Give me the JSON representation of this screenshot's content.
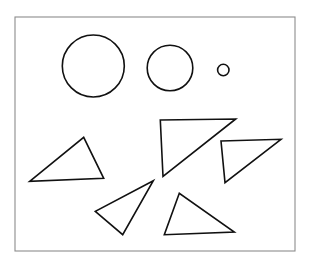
{
  "figure": {
    "background_color": "#ffffff",
    "width": 311,
    "height": 265,
    "frame": {
      "name": "figure-border",
      "x": 15,
      "y": 17,
      "width": 280,
      "height": 234,
      "stroke_color": "#8c8c8c",
      "stroke_width": 1.1,
      "fill_color": "#ffffff"
    },
    "shape_style": {
      "stroke_color": "#111111",
      "stroke_width": 1.6,
      "fill": "none"
    },
    "counts": {
      "circles": 3,
      "triangles": 5,
      "total_shapes": 8
    },
    "circles": [
      {
        "name": "large-circle",
        "label": "large circle",
        "cx": 93.3,
        "cy": 66,
        "r": 31
      },
      {
        "name": "medium-circle",
        "label": "medium circle",
        "cx": 170,
        "cy": 68,
        "r": 22.8
      },
      {
        "name": "small-circle",
        "label": "small circle",
        "cx": 223.3,
        "cy": 70,
        "r": 5.7
      }
    ],
    "triangles": [
      {
        "name": "left-triangle",
        "label": "left obtuse triangle",
        "points": "29.7,181.3 83.7,137.3 103.7,178.3"
      },
      {
        "name": "center-large-right-triangle",
        "label": "large right triangle",
        "points": "160.3,120.0 235.7,119.0 163.0,176.5"
      },
      {
        "name": "right-right-triangle",
        "label": "right-side right triangle",
        "points": "221.0,141.0 281.0,139.3 225.0,182.7"
      },
      {
        "name": "lower-left-rotated-triangle",
        "label": "lower left rotated triangle",
        "points": "153.3,180.7 95.3,211.3 122.7,234.7"
      },
      {
        "name": "bottom-center-triangle",
        "label": "bottom center triangle",
        "points": "179.3,193.3 164.3,234.7 234.3,232.0"
      }
    ]
  }
}
